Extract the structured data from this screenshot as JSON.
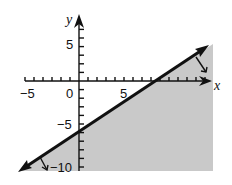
{
  "chart_data": {
    "type": "line",
    "title": "",
    "xlabel": "x",
    "ylabel": "y",
    "inequality": "y <= (3/4)x - 6",
    "boundary_line": {
      "slope": 0.75,
      "y_intercept": -6,
      "x_intercept": 8,
      "style": "solid",
      "arrows": "both ends"
    },
    "shaded_region": "below the line",
    "xlim": [
      -6,
      15
    ],
    "ylim": [
      -10.5,
      6.5
    ],
    "x_tick_labels": [
      "-5",
      "0",
      "5"
    ],
    "y_tick_labels": [
      "5",
      "-5",
      "-10"
    ],
    "tick_interval": 1,
    "grid": false,
    "colors": {
      "shade": "#c9c9c9",
      "line": "#111111",
      "axis": "#111111"
    }
  },
  "labels": {
    "x_axis": "x",
    "y_axis": "y",
    "x_neg5": "−5",
    "x_0": "0",
    "x_5": "5",
    "y_5": "5",
    "y_neg5": "−5",
    "y_neg10": "−10"
  }
}
